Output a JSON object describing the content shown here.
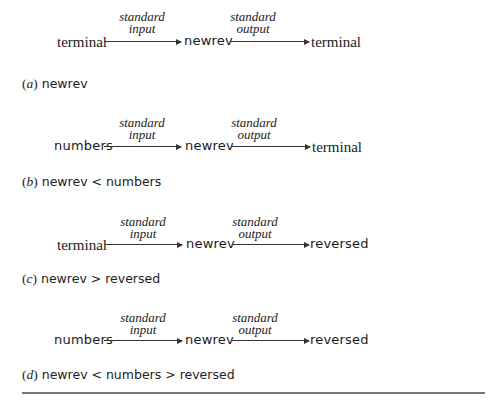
{
  "diagrams": [
    {
      "id": "a",
      "source": {
        "text": "terminal",
        "style": "serif"
      },
      "input_label": [
        "standard",
        "input"
      ],
      "program": "newrev",
      "output_label": [
        "standard",
        "output"
      ],
      "target": {
        "text": "terminal",
        "style": "serif"
      },
      "caption_letter": "a",
      "caption_command": "newrev"
    },
    {
      "id": "b",
      "source": {
        "text": "numbers",
        "style": "sans"
      },
      "input_label": [
        "standard",
        "input"
      ],
      "program": "newrev",
      "output_label": [
        "standard",
        "output"
      ],
      "target": {
        "text": "terminal",
        "style": "serif"
      },
      "caption_letter": "b",
      "caption_command": "newrev < numbers"
    },
    {
      "id": "c",
      "source": {
        "text": "terminal",
        "style": "serif"
      },
      "input_label": [
        "standard",
        "input"
      ],
      "program": "newrev",
      "output_label": [
        "standard",
        "output"
      ],
      "target": {
        "text": "reversed",
        "style": "sans"
      },
      "caption_letter": "c",
      "caption_command": "newrev > reversed"
    },
    {
      "id": "d",
      "source": {
        "text": "numbers",
        "style": "sans"
      },
      "input_label": [
        "standard",
        "input"
      ],
      "program": "newrev",
      "output_label": [
        "standard",
        "output"
      ],
      "target": {
        "text": "reversed",
        "style": "sans"
      },
      "caption_letter": "d",
      "caption_command": "newrev < numbers > reversed"
    }
  ]
}
